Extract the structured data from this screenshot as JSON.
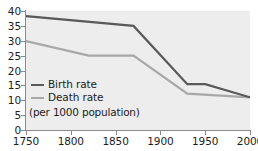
{
  "chart_data": {
    "type": "line",
    "title": "",
    "subtitle": "",
    "xlabel": "",
    "ylabel": "",
    "note": "(per 1000 population)",
    "xlim": [
      1750,
      2000
    ],
    "ylim": [
      0,
      40
    ],
    "grid": false,
    "legend_position": "inside-bottom-left",
    "x_ticks": [
      "1750",
      "1800",
      "1850",
      "1900",
      "1950",
      "2000"
    ],
    "y_ticks": [
      "0",
      "5",
      "10",
      "15",
      "20",
      "25",
      "30",
      "35",
      "40"
    ],
    "series": [
      {
        "name": "Birth rate",
        "color": "#595959",
        "points": [
          {
            "x": 1750,
            "y": 38.3
          },
          {
            "x": 1870,
            "y": 35.0
          },
          {
            "x": 1930,
            "y": 15.4
          },
          {
            "x": 1950,
            "y": 15.4
          },
          {
            "x": 2000,
            "y": 11.0
          }
        ]
      },
      {
        "name": "Death rate",
        "color": "#a8a8a8",
        "points": [
          {
            "x": 1750,
            "y": 29.9
          },
          {
            "x": 1820,
            "y": 25.0
          },
          {
            "x": 1870,
            "y": 25.0
          },
          {
            "x": 1930,
            "y": 12.2
          },
          {
            "x": 2000,
            "y": 11.0
          }
        ]
      }
    ]
  },
  "legend": {
    "birth_label": "Birth rate",
    "death_label": "Death rate",
    "note": "(per 1000 population)",
    "birth_color": "#595959",
    "death_color": "#a8a8a8"
  },
  "axes": {
    "y_labels": [
      "40",
      "35",
      "30",
      "25",
      "20",
      "15",
      "10",
      "5",
      "0"
    ],
    "x_labels": [
      "1750",
      "1800",
      "1850",
      "1900",
      "1950",
      "2000"
    ]
  },
  "colors": {
    "plot_background": "#ededed",
    "axis": "#8a8a8a",
    "text": "#1c1c1c"
  }
}
